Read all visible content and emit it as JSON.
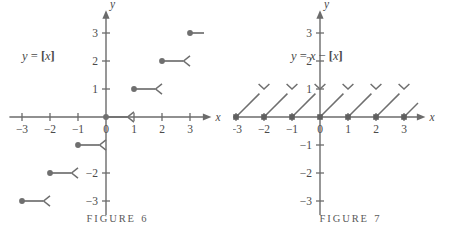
{
  "page": {
    "background": "#ffffff",
    "ink": "#4a4a4a",
    "curve_color": "#6f6f6f",
    "axis_color": "#6b6b6b"
  },
  "figures": [
    {
      "id": "figure-6",
      "caption_word": "FIGURE",
      "caption_number": "6",
      "equation": {
        "lhs": "y",
        "eq": "=",
        "bracket_open": "[",
        "arg": "x",
        "bracket_close": "]",
        "full": "y = [x]"
      },
      "x_axis_name": "x",
      "y_axis_name": "y",
      "x_ticks": [
        "-3",
        "-2",
        "-1",
        "0",
        "1",
        "2",
        "3"
      ],
      "y_ticks": [
        "3",
        "2",
        "1",
        "-2",
        "-3"
      ],
      "origin_label": "0",
      "chart_data": {
        "type": "line",
        "title": "y = [x]",
        "subtitle": "greatest integer (floor) step function",
        "xlabel": "x",
        "ylabel": "y",
        "xlim": [
          -3.4,
          3.6
        ],
        "ylim": [
          -3.4,
          3.4
        ],
        "grid": false,
        "legend": "none",
        "xticks": [
          -3,
          -2,
          -1,
          0,
          1,
          2,
          3
        ],
        "yticks": [
          3,
          2,
          1,
          -2,
          -3
        ],
        "segments": [
          {
            "x_start": -3,
            "x_end": -2,
            "y": -3,
            "left_endpoint": "closed",
            "right_endpoint": "open"
          },
          {
            "x_start": -2,
            "x_end": -1,
            "y": -2,
            "left_endpoint": "closed",
            "right_endpoint": "open"
          },
          {
            "x_start": -1,
            "x_end": 0,
            "y": -1,
            "left_endpoint": "closed",
            "right_endpoint": "open"
          },
          {
            "x_start": 0,
            "x_end": 1,
            "y": 0,
            "left_endpoint": "closed",
            "right_endpoint": "open"
          },
          {
            "x_start": 1,
            "x_end": 2,
            "y": 1,
            "left_endpoint": "closed",
            "right_endpoint": "open"
          },
          {
            "x_start": 2,
            "x_end": 3,
            "y": 2,
            "left_endpoint": "closed",
            "right_endpoint": "open"
          },
          {
            "x_start": 3,
            "x_end": 3.5,
            "y": 3,
            "left_endpoint": "closed",
            "right_endpoint": "none"
          }
        ]
      }
    },
    {
      "id": "figure-7",
      "caption_word": "FIGURE",
      "caption_number": "7",
      "equation": {
        "lhs": "y",
        "eq": "=",
        "arg1": "x",
        "minus": "−",
        "bracket_open": "[",
        "arg2": "x",
        "bracket_close": "]",
        "full": "y = x − [x]"
      },
      "x_axis_name": "x",
      "y_axis_name": "y",
      "x_ticks": [
        "-3",
        "-2",
        "-1",
        "0",
        "1",
        "2",
        "3"
      ],
      "y_ticks": [
        "3",
        "2",
        "1",
        "-1",
        "-2",
        "-3"
      ],
      "origin_label": "0",
      "chart_data": {
        "type": "line",
        "title": "y = x - [x]",
        "subtitle": "fractional part (sawtooth) function",
        "xlabel": "x",
        "ylabel": "y",
        "xlim": [
          -3.4,
          3.6
        ],
        "ylim": [
          -3.4,
          3.4
        ],
        "grid": false,
        "legend": "none",
        "xticks": [
          -3,
          -2,
          -1,
          0,
          1,
          2,
          3
        ],
        "yticks": [
          3,
          2,
          1,
          -1,
          -2,
          -3
        ],
        "segments": [
          {
            "x_start": -3,
            "y_start": 0,
            "x_end": -2,
            "y_end": 1,
            "left_endpoint": "closed",
            "right_endpoint": "open"
          },
          {
            "x_start": -2,
            "y_start": 0,
            "x_end": -1,
            "y_end": 1,
            "left_endpoint": "closed",
            "right_endpoint": "open"
          },
          {
            "x_start": -1,
            "y_start": 0,
            "x_end": 0,
            "y_end": 1,
            "left_endpoint": "closed",
            "right_endpoint": "open"
          },
          {
            "x_start": 0,
            "y_start": 0,
            "x_end": 1,
            "y_end": 1,
            "left_endpoint": "closed",
            "right_endpoint": "open"
          },
          {
            "x_start": 1,
            "y_start": 0,
            "x_end": 2,
            "y_end": 1,
            "left_endpoint": "closed",
            "right_endpoint": "open"
          },
          {
            "x_start": 2,
            "y_start": 0,
            "x_end": 3,
            "y_end": 1,
            "left_endpoint": "closed",
            "right_endpoint": "open"
          },
          {
            "x_start": 3,
            "y_start": 0,
            "x_end": 3.5,
            "y_end": 0.5,
            "left_endpoint": "closed",
            "right_endpoint": "none"
          }
        ]
      }
    }
  ]
}
